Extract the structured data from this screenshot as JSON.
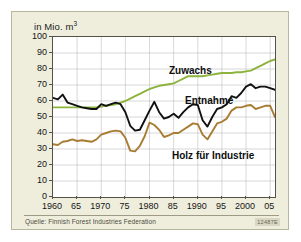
{
  "figure": {
    "axis_title": "in Mio. m",
    "axis_title_exponent": "3",
    "source": "Quelle: Finnish Forest Industries Federation",
    "ident": "12487E"
  },
  "colors": {
    "card_background": "#efeedd",
    "plot_background": "#ffffff",
    "frame": "#55524a",
    "grid": "#bdbdbd",
    "zuwachs": "#8cb33c",
    "entnahme": "#111111",
    "holz": "#a87c32"
  },
  "chart_data": {
    "type": "line",
    "title": "",
    "subtitle": "",
    "xlabel": "",
    "ylabel": "in Mio. m3",
    "xlim": [
      1960,
      2006
    ],
    "ylim": [
      0,
      100
    ],
    "ytick_step": 10,
    "grid": true,
    "legend_position": "inline-labels",
    "ytick_labels": [
      "0",
      "10",
      "20",
      "30",
      "40",
      "50",
      "60",
      "70",
      "80",
      "90",
      "100"
    ],
    "ytick_values": [
      0,
      10,
      20,
      30,
      40,
      50,
      60,
      70,
      80,
      90,
      100
    ],
    "xtick_labels": [
      "1960",
      "65",
      "1970",
      "75",
      "1980",
      "85",
      "1990",
      "95",
      "2000",
      "05"
    ],
    "xtick_values": [
      1960,
      1965,
      1970,
      1975,
      1980,
      1985,
      1990,
      1995,
      2000,
      2005
    ],
    "gridline_x_values": [
      1965,
      1970,
      1975,
      1980,
      1985,
      1990,
      1995,
      2000,
      2005
    ],
    "gridline_y_values": [
      10,
      20,
      30,
      40,
      50,
      60,
      70,
      80,
      90
    ],
    "x": [
      1960,
      1961,
      1962,
      1963,
      1964,
      1965,
      1966,
      1967,
      1968,
      1969,
      1970,
      1971,
      1972,
      1973,
      1974,
      1975,
      1976,
      1977,
      1978,
      1979,
      1980,
      1981,
      1982,
      1983,
      1984,
      1985,
      1986,
      1987,
      1988,
      1989,
      1990,
      1991,
      1992,
      1993,
      1994,
      1995,
      1996,
      1997,
      1998,
      1999,
      2000,
      2001,
      2002,
      2003,
      2004,
      2005,
      2006
    ],
    "series": [
      {
        "name": "Zuwachs",
        "color": "#8cb33c",
        "label_anchor_year": 1986,
        "values": [
          56,
          56,
          56,
          56,
          56,
          56,
          56,
          56,
          56,
          56,
          56.5,
          57,
          57.5,
          58,
          59,
          60,
          61.5,
          63,
          64.5,
          66,
          67.5,
          68.5,
          69.5,
          70,
          70.5,
          71,
          72.5,
          74,
          75.5,
          75.5,
          75.5,
          75.5,
          76,
          76.5,
          77,
          77.5,
          77.5,
          77.5,
          78,
          78,
          78.5,
          79,
          80.5,
          82,
          83.5,
          85,
          86
        ]
      },
      {
        "name": "Entnahme",
        "color": "#111111",
        "label_anchor_year": 1992,
        "values": [
          62,
          61,
          64,
          59,
          58,
          57,
          56,
          55.5,
          55,
          55,
          58,
          57,
          58,
          59,
          58,
          53,
          44.5,
          41.5,
          42,
          48,
          54,
          59.5,
          53,
          49,
          50,
          52,
          49.5,
          53,
          56,
          58,
          57.5,
          48,
          44,
          50,
          55,
          56,
          58,
          63,
          62,
          65,
          69,
          70.5,
          68,
          69,
          69,
          68,
          67
        ]
      },
      {
        "name": "Holz für Industrie",
        "color": "#a87c32",
        "label_anchor_year": 1987,
        "values": [
          33,
          32.5,
          34.5,
          35,
          36,
          35,
          35.5,
          35,
          34.5,
          36,
          39,
          40,
          41,
          41.5,
          41,
          37,
          29,
          28.5,
          32,
          38,
          46.5,
          45,
          42,
          37.5,
          38.5,
          40,
          40,
          42,
          44,
          46,
          45.5,
          39,
          36,
          41,
          46,
          47,
          49,
          54,
          56,
          56,
          57,
          57.5,
          55,
          56,
          57,
          57,
          50
        ]
      }
    ]
  }
}
